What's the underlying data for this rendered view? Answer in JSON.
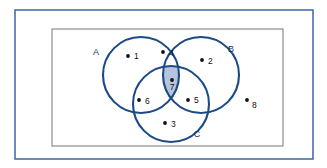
{
  "figure": {
    "type": "venn-diagram",
    "colors": {
      "outer_border": "#4a6fa5",
      "universe_border": "#8c8c8c",
      "circle_stroke": "#1c4a85",
      "shaded_region_fill": "#b6c4dc",
      "point_color": "#111111",
      "set_label_color": "#15325e",
      "background": "#ffffff"
    },
    "outer_frame": {
      "x": 15,
      "y": 10,
      "width": 298,
      "height": 149,
      "stroke_width": 1.6
    },
    "universe_rect": {
      "x": 52,
      "y": 29,
      "width": 231,
      "height": 117,
      "stroke_width": 1.2,
      "label": ""
    },
    "sets": [
      {
        "name": "A",
        "label": "A",
        "label_x": 96,
        "label_y": 55,
        "cx": 141,
        "cy": 75,
        "r": 38
      },
      {
        "name": "B",
        "label": "B",
        "label_x": 231,
        "label_y": 52,
        "cx": 201,
        "cy": 75,
        "r": 38
      },
      {
        "name": "C",
        "label": "C",
        "label_x": 197,
        "label_y": 137,
        "cx": 171,
        "cy": 104,
        "r": 38
      }
    ],
    "shaded_regions": [
      {
        "name": "A-intersect-B-intersect-C",
        "sets": [
          "A",
          "B",
          "C"
        ],
        "fill": "#b6c4dc"
      }
    ],
    "points": [
      {
        "id": "1",
        "label": "1",
        "dot_x": 128,
        "dot_y": 56,
        "label_x": 134,
        "label_y": 59,
        "region": "A only"
      },
      {
        "id": "2",
        "label": "2",
        "dot_x": 202,
        "dot_y": 60,
        "label_x": 208,
        "label_y": 64,
        "region": "B only"
      },
      {
        "id": "3",
        "label": "3",
        "dot_x": 165,
        "dot_y": 123,
        "label_x": 171,
        "label_y": 127,
        "region": "C only"
      },
      {
        "id": "4",
        "label": "4",
        "dot_x": 163,
        "dot_y": 52,
        "label_x": 169,
        "label_y": 56,
        "region": "A and B only"
      },
      {
        "id": "5",
        "label": "5",
        "dot_x": 188,
        "dot_y": 100,
        "label_x": 194,
        "label_y": 103,
        "region": "B and C only"
      },
      {
        "id": "6",
        "label": "6",
        "dot_x": 139,
        "dot_y": 100,
        "label_x": 145,
        "label_y": 104,
        "region": "A and C only"
      },
      {
        "id": "7",
        "label": "7",
        "dot_x": 172,
        "dot_y": 80,
        "label_x": 172,
        "label_y": 90,
        "region": "A and B and C"
      },
      {
        "id": "8",
        "label": "8",
        "dot_x": 247,
        "dot_y": 100,
        "label_x": 252,
        "label_y": 108,
        "region": "outside all sets"
      }
    ]
  }
}
